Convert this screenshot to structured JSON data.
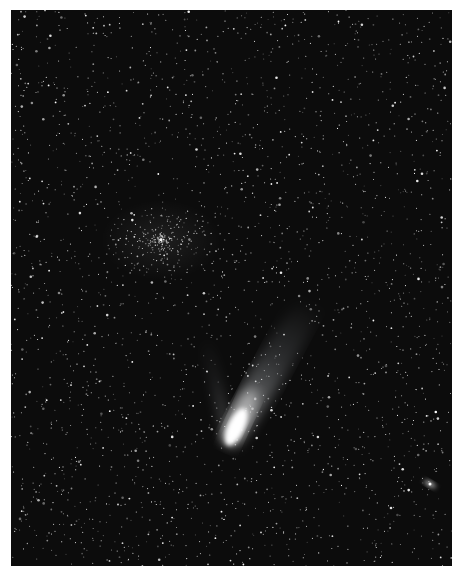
{
  "image": {
    "subject": "Night sky star field with a bright comet",
    "background_color": "#0c0c0c",
    "frame_color": "#ffffff",
    "comet": {
      "nucleus": {
        "x": 218,
        "y": 430
      },
      "tail_direction": "up-right",
      "color": "#ffffff"
    },
    "galaxy": {
      "x": 419,
      "y": 474
    },
    "star_cluster": {
      "x": 150,
      "y": 230
    }
  }
}
